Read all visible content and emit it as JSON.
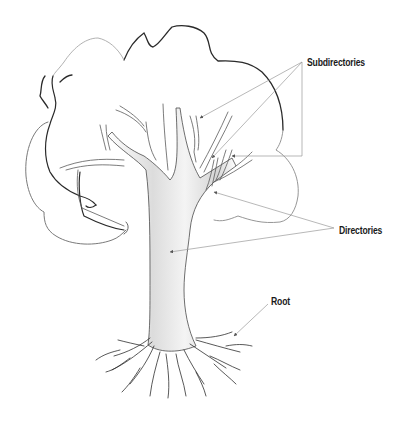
{
  "diagram": {
    "type": "illustration",
    "labels": {
      "subdirectories": "Subdirectories",
      "directories": "Directories",
      "root": "Root"
    },
    "callouts": [
      {
        "label": "Subdirectories",
        "arrow_count": 3
      },
      {
        "label": "Directories",
        "arrow_count": 2
      },
      {
        "label": "Root",
        "arrow_count": 1
      }
    ],
    "colors": {
      "outline_dark": "#2a2a2a",
      "outline_light": "#9a9a9a",
      "leader_line": "#a8a8a8",
      "trunk_shade": "#d8d8d8",
      "label_text": "#1a1a1a",
      "background": "#ffffff"
    }
  }
}
